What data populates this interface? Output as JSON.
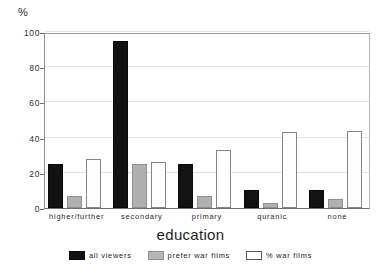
{
  "chart_data": {
    "type": "bar",
    "title": "",
    "xlabel": "education",
    "ylabel": "%",
    "ylim": [
      0,
      100
    ],
    "yticks": [
      0,
      20,
      40,
      60,
      80,
      100
    ],
    "grid": true,
    "legend_position": "bottom",
    "categories": [
      "higher/further",
      "secondary",
      "primary",
      "quranic",
      "none"
    ],
    "series": [
      {
        "name": "all viewers",
        "color": "#121212",
        "values": [
          25,
          95,
          25,
          10,
          10
        ]
      },
      {
        "name": "prefer war films",
        "color": "#b0b0b0",
        "values": [
          7,
          25,
          7,
          3,
          5
        ]
      },
      {
        "name": "% war films",
        "color": "#ffffff",
        "values": [
          28,
          26,
          33,
          43,
          44
        ]
      }
    ]
  },
  "axes": {
    "y_unit_label": "%",
    "x_axis_title": "education"
  },
  "legend": {
    "items": [
      {
        "label": "all viewers",
        "swatch": "all-viewers"
      },
      {
        "label": "prefer war films",
        "swatch": "prefer"
      },
      {
        "label": "% war films",
        "swatch": "pct"
      }
    ]
  }
}
